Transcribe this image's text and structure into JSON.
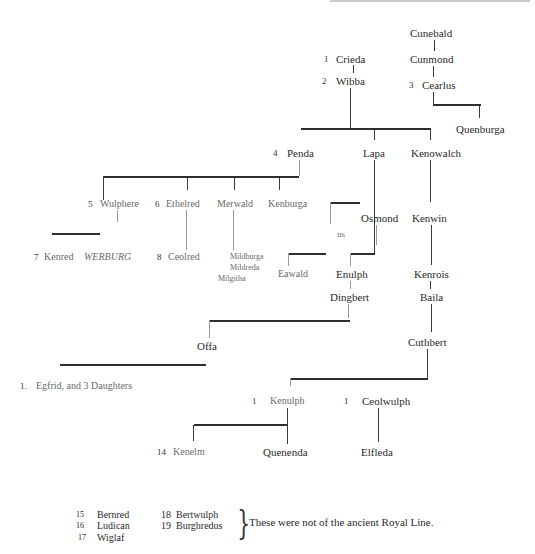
{
  "diagram": {
    "type": "genealogy-tree",
    "nodes": {
      "cunebald": "Cunebald",
      "cunmond": "Cunmond",
      "cearlus": "Cearlus",
      "cearlus_num": "3",
      "quenburga": "Quenburga",
      "crieda": "Crieda",
      "crieda_num": "1",
      "wibba": "Wibba",
      "wibba_num": "2",
      "penda": "Penda",
      "penda_num": "4",
      "lapa": "Lapa",
      "kenowalch": "Kenowalch",
      "wulphere": "Wulphere",
      "wulphere_num": "5",
      "ethelred": "Ethelred",
      "ethelred_num": "6",
      "merwald": "Merwald",
      "kenburga": "Kenburga",
      "osmond": "Osmond",
      "us": "us",
      "kenwin": "Kenwin",
      "kenred": "Kenred",
      "kenred_num": "7",
      "werburg": "WERBURG",
      "ceolred": "Ceolred",
      "ceolred_num": "8",
      "mildburga": "Mildburga",
      "mildreda": "Mildreda",
      "milgitha": "Milgitha",
      "eawald": "Eawald",
      "enulph": "Enulph",
      "kenrois": "Kenrois",
      "dingbert": "Dingbert",
      "baila": "Baila",
      "offa": "Offa",
      "offa_num": "",
      "cuthbert": "Cuthbert",
      "egfrid": "Egfrid, and 3 Daughters",
      "egfrid_num": "1.",
      "kenulph": "Kenulph",
      "kenulph_num": "1",
      "ceolwulph": "Ceolwulph",
      "ceolwulph_num": "1",
      "kenelm": "Kenelm",
      "kenelm_num": "14",
      "quenenda": "Quenenda",
      "elfleda": "Elfleda"
    },
    "footnote": {
      "items": [
        {
          "num": "15",
          "name": "Bernred"
        },
        {
          "num": "16",
          "name": "Ludican"
        },
        {
          "num": "17",
          "name": "Wiglaf"
        },
        {
          "num": "18",
          "name": "Bertwulph"
        },
        {
          "num": "19",
          "name": "Burghredus"
        }
      ],
      "brace": "}",
      "note": "These were not of the ancient Royal Line."
    }
  }
}
